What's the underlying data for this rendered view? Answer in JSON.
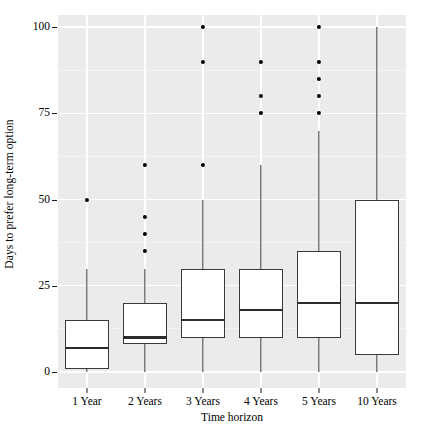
{
  "chart_data": {
    "type": "boxplot",
    "title": "",
    "xlabel": "Time horizon",
    "ylabel": "Days to prefer long-term option",
    "categories": [
      "1 Year",
      "2 Years",
      "3 Years",
      "4 Years",
      "5 Years",
      "10 Years"
    ],
    "ylim": [
      -2,
      103
    ],
    "yticks": [
      0,
      25,
      50,
      75,
      100
    ],
    "ytick_labels": [
      "0",
      "25",
      "50",
      "75",
      "100"
    ],
    "grid": "horizontal-and-vertical major white gridlines on gray panel",
    "legend": "none",
    "panel_background": "#ebebeb",
    "gridline_color": "#ffffff",
    "box_fill": "#ffffff",
    "box_stroke": "#3a3a3a",
    "outlier_color": "#000000",
    "boxes": [
      {
        "category": "1 Year",
        "whisker_low": 0,
        "q1": 1,
        "median": 7,
        "q3": 15,
        "whisker_high": 30,
        "outliers": [
          50
        ]
      },
      {
        "category": "2 Years",
        "whisker_low": 0,
        "q1": 8,
        "median": 10,
        "q3": 20,
        "whisker_high": 30,
        "outliers": [
          60,
          45,
          40,
          35
        ]
      },
      {
        "category": "3 Years",
        "whisker_low": 0,
        "q1": 10,
        "median": 15,
        "q3": 30,
        "whisker_high": 50,
        "outliers": [
          100,
          90,
          60
        ]
      },
      {
        "category": "4 Years",
        "whisker_low": 0,
        "q1": 10,
        "median": 18,
        "q3": 30,
        "whisker_high": 60,
        "outliers": [
          90,
          80,
          75
        ]
      },
      {
        "category": "5 Years",
        "whisker_low": 0,
        "q1": 10,
        "median": 20,
        "q3": 35,
        "whisker_high": 70,
        "outliers": [
          100,
          90,
          85,
          80,
          75
        ]
      },
      {
        "category": "10 Years",
        "whisker_low": 0,
        "q1": 5,
        "median": 20,
        "q3": 50,
        "whisker_high": 100,
        "outliers": []
      }
    ]
  },
  "axes": {
    "y_title": "Days to prefer long-term option",
    "x_title": "Time horizon"
  }
}
